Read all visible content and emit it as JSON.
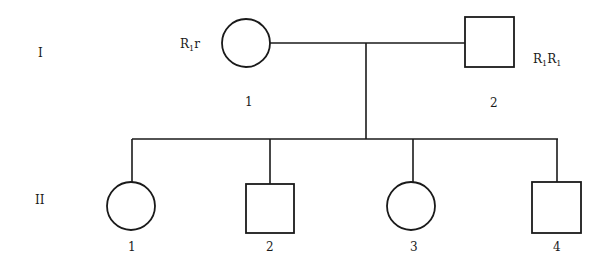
{
  "diagram": {
    "type": "pedigree",
    "generations": [
      {
        "label": "I",
        "individuals": [
          {
            "number": "1",
            "sex": "female",
            "shape": "circle",
            "genotype": {
              "base1": "R",
              "sub1": "1",
              "base2": "r",
              "sub2": ""
            }
          },
          {
            "number": "2",
            "sex": "male",
            "shape": "square",
            "genotype": {
              "base1": "R",
              "sub1": "1",
              "base2": "R",
              "sub2": "1"
            }
          }
        ]
      },
      {
        "label": "II",
        "individuals": [
          {
            "number": "1",
            "sex": "female",
            "shape": "circle"
          },
          {
            "number": "2",
            "sex": "male",
            "shape": "square"
          },
          {
            "number": "3",
            "sex": "female",
            "shape": "circle"
          },
          {
            "number": "4",
            "sex": "male",
            "shape": "square"
          }
        ]
      }
    ],
    "relationships": [
      {
        "type": "mating",
        "between": [
          "I-1",
          "I-2"
        ],
        "offspring": [
          "II-1",
          "II-2",
          "II-3",
          "II-4"
        ]
      }
    ],
    "colors": {
      "line": "#1a1a1a",
      "background": "#ffffff"
    }
  }
}
